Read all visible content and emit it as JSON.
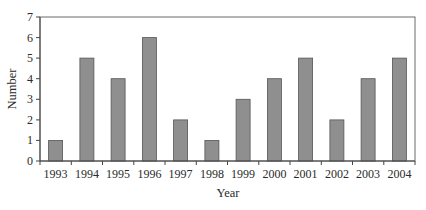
{
  "chart_data": {
    "type": "bar",
    "title": "",
    "xlabel": "Year",
    "ylabel": "Number",
    "categories": [
      "1993",
      "1994",
      "1995",
      "1996",
      "1997",
      "1998",
      "1999",
      "2000",
      "2001",
      "2002",
      "2003",
      "2004"
    ],
    "values": [
      1,
      5,
      4,
      6,
      2,
      1,
      3,
      4,
      5,
      2,
      4,
      5
    ],
    "ylim": [
      0,
      7
    ],
    "yticks": [
      0,
      1,
      2,
      3,
      4,
      5,
      6,
      7
    ],
    "grid": false,
    "legend": null,
    "colors": {
      "bar_fill": "#8f8f8f",
      "bar_edge": "#555555",
      "axis": "#444444"
    }
  }
}
